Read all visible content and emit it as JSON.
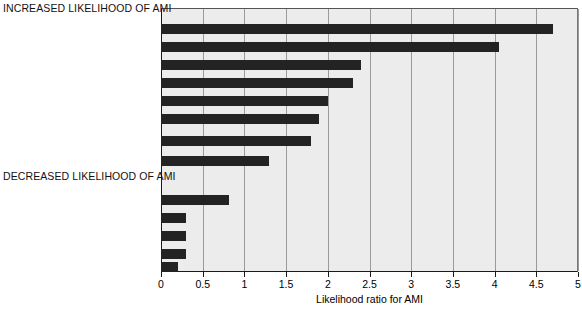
{
  "chart_data": {
    "type": "bar",
    "orientation": "horizontal",
    "title": "",
    "xlabel": "Likelihood ratio for AMI",
    "ylabel": "",
    "xlim": [
      0,
      5
    ],
    "xticks": [
      "0",
      "0.5",
      "1",
      "1.5",
      "2",
      "2.5",
      "3",
      "3.5",
      "4",
      "4.5",
      "5"
    ],
    "xtick_values": [
      0,
      0.5,
      1,
      1.5,
      2,
      2.5,
      3,
      3.5,
      4,
      4.5,
      5
    ],
    "grid": "vertical",
    "legend": "none",
    "sections": [
      {
        "banner": "INCREASED LIKELIHOOD OF AMI",
        "categories": [
          "Radiation to right arm or shoulder",
          "Radiation to both arms or shoulders",
          "Associated with exertion",
          "Radiation to left arm",
          "Associated with diaphoresis",
          "Associated with nausea or vomiting",
          "Worse than previous angina\nor similar to previous MI",
          "Described as pressure"
        ],
        "values": [
          4.7,
          4.05,
          2.4,
          2.3,
          2.0,
          1.9,
          1.8,
          1.3
        ]
      },
      {
        "banner": "DECREASED LIKELIHOOD OF AMI",
        "categories": [
          "Inframammary location",
          "Reproducible with palpation",
          "Described as sharp",
          "Described as positional",
          "Described as pleuritic"
        ],
        "values": [
          0.82,
          0.3,
          0.3,
          0.3,
          0.2
        ]
      }
    ],
    "categories": [
      "Radiation to right arm or shoulder",
      "Radiation to both arms or shoulders",
      "Associated with exertion",
      "Radiation to left arm",
      "Associated with diaphoresis",
      "Associated with nausea or vomiting",
      "Worse than previous angina or similar to previous MI",
      "Described as pressure",
      "Inframammary location",
      "Reproducible with palpation",
      "Described as sharp",
      "Described as positional",
      "Described as pleuritic"
    ],
    "values": [
      4.7,
      4.05,
      2.4,
      2.3,
      2.0,
      1.9,
      1.8,
      1.3,
      0.82,
      0.3,
      0.3,
      0.3,
      0.2
    ],
    "colors": {
      "bar": "#232323",
      "plot_background": "#ececec",
      "gridline": "#9a9a9a",
      "axis": "#1a1a1a",
      "text": "#000000"
    }
  },
  "labels": {
    "banner_increased": "INCREASED LIKELIHOOD OF AMI",
    "banner_decreased": "DECREASED LIKELIHOOD OF AMI",
    "cat_0": "Radiation to right arm or shoulder",
    "cat_1": "Radiation to both arms or shoulders",
    "cat_2": "Associated with exertion",
    "cat_3": "Radiation to left arm",
    "cat_4": "Associated with diaphoresis",
    "cat_5": "Associated with nausea or vomiting",
    "cat_6_line1": "Worse than previous angina",
    "cat_6_line2": "or similar to previous MI",
    "cat_7": "Described as pressure",
    "cat_8": "Inframammary location",
    "cat_9": "Reproducible with palpation",
    "cat_10": "Described as sharp",
    "cat_11": "Described as positional",
    "cat_12": "Described as pleuritic",
    "axis_title": "Likelihood ratio for AMI",
    "tick_0": "0",
    "tick_1": "0.5",
    "tick_2": "1",
    "tick_3": "1.5",
    "tick_4": "2",
    "tick_5": "2.5",
    "tick_6": "3",
    "tick_7": "3.5",
    "tick_8": "4",
    "tick_9": "4.5",
    "tick_10": "5"
  }
}
